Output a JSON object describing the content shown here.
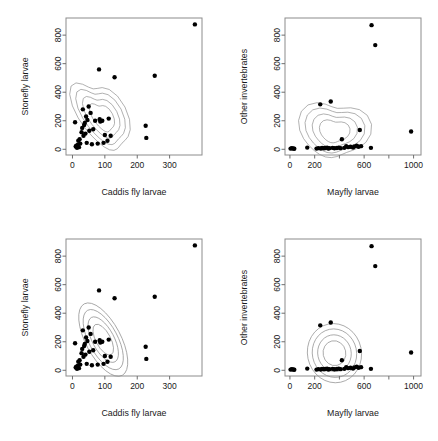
{
  "figure": {
    "title": "",
    "layout": "2x2 grid of scatter plots with density contours",
    "background": "#ffffff",
    "point_color": "#000000",
    "contour_color": "#8f8f8f"
  },
  "chart_data": [
    {
      "type": "scatter",
      "panel": "top-left",
      "title": "",
      "xlabel": "Caddis fly larvae",
      "ylabel": "Stonefly larvae",
      "xlim": [
        -20,
        400
      ],
      "ylim": [
        -40,
        920
      ],
      "xticks": [
        0,
        100,
        200,
        300
      ],
      "yticks": [
        0,
        200,
        400,
        600,
        800
      ],
      "xticklabels": [
        "0",
        "100",
        "200",
        "300"
      ],
      "yticklabels": [
        "0",
        "200",
        "400",
        "600",
        "800"
      ],
      "grid": false,
      "legend": "none",
      "contour_style": "kernel-density",
      "x": [
        8,
        10,
        12,
        14,
        16,
        18,
        20,
        22,
        24,
        28,
        30,
        32,
        34,
        36,
        38,
        40,
        42,
        44,
        46,
        50,
        52,
        56,
        60,
        64,
        70,
        78,
        82,
        84,
        86,
        92,
        96,
        100,
        108,
        112,
        118,
        130,
        226,
        228,
        254,
        378
      ],
      "y": [
        190,
        20,
        25,
        10,
        30,
        60,
        15,
        70,
        40,
        120,
        150,
        280,
        95,
        170,
        185,
        110,
        230,
        45,
        205,
        300,
        130,
        255,
        35,
        140,
        200,
        40,
        560,
        210,
        195,
        200,
        45,
        100,
        60,
        215,
        95,
        505,
        165,
        80,
        515,
        875
      ]
    },
    {
      "type": "scatter",
      "panel": "top-right",
      "title": "",
      "xlabel": "Mayfly larvae",
      "ylabel": "Other invertebrates",
      "xlim": [
        -40,
        1060
      ],
      "ylim": [
        -40,
        920
      ],
      "xticks": [
        0,
        200,
        400,
        600,
        800,
        1000
      ],
      "yticks": [
        0,
        200,
        400,
        600,
        800
      ],
      "xticklabels": [
        "0",
        "200",
        "",
        "600",
        "",
        "1000"
      ],
      "yticklabels": [
        "0",
        "200",
        "400",
        "600",
        "800"
      ],
      "grid": false,
      "legend": "none",
      "contour_style": "kernel-density",
      "x": [
        5,
        15,
        25,
        35,
        140,
        215,
        230,
        245,
        250,
        260,
        275,
        285,
        300,
        310,
        320,
        330,
        345,
        360,
        380,
        395,
        410,
        420,
        440,
        455,
        470,
        490,
        510,
        520,
        540,
        555,
        565,
        575,
        655,
        660,
        690,
        980
      ],
      "y": [
        5,
        8,
        6,
        4,
        12,
        5,
        8,
        315,
        6,
        10,
        7,
        9,
        12,
        6,
        8,
        335,
        10,
        7,
        9,
        12,
        8,
        70,
        10,
        22,
        15,
        18,
        12,
        20,
        25,
        18,
        135,
        22,
        10,
        870,
        730,
        125
      ]
    },
    {
      "type": "scatter",
      "panel": "bottom-left",
      "title": "",
      "xlabel": "Caddis fly larvae",
      "ylabel": "Stonefly larvae",
      "xlim": [
        -20,
        400
      ],
      "ylim": [
        -40,
        920
      ],
      "xticks": [
        0,
        100,
        200,
        300
      ],
      "yticks": [
        0,
        200,
        400,
        600,
        800
      ],
      "xticklabels": [
        "0",
        "100",
        "200",
        "300"
      ],
      "yticklabels": [
        "0",
        "200",
        "400",
        "600",
        "800"
      ],
      "grid": false,
      "legend": "none",
      "contour_style": "bivariate-normal-ellipse",
      "x": [
        8,
        10,
        12,
        14,
        16,
        18,
        20,
        22,
        24,
        28,
        30,
        32,
        34,
        36,
        38,
        40,
        42,
        44,
        46,
        50,
        52,
        56,
        60,
        64,
        70,
        78,
        82,
        84,
        86,
        92,
        96,
        100,
        108,
        112,
        118,
        130,
        226,
        228,
        254,
        378
      ],
      "y": [
        190,
        20,
        25,
        10,
        30,
        60,
        15,
        70,
        40,
        120,
        150,
        280,
        95,
        170,
        185,
        110,
        230,
        45,
        205,
        300,
        130,
        255,
        35,
        140,
        200,
        40,
        560,
        210,
        195,
        200,
        45,
        100,
        60,
        215,
        95,
        505,
        165,
        80,
        515,
        875
      ]
    },
    {
      "type": "scatter",
      "panel": "bottom-right",
      "title": "",
      "xlabel": "Mayfly larvae",
      "ylabel": "Other invertebrates",
      "xlim": [
        -40,
        1060
      ],
      "ylim": [
        -40,
        920
      ],
      "xticks": [
        0,
        200,
        400,
        600,
        800,
        1000
      ],
      "yticks": [
        0,
        200,
        400,
        600,
        800
      ],
      "xticklabels": [
        "0",
        "200",
        "",
        "600",
        "",
        "1000"
      ],
      "yticklabels": [
        "0",
        "200",
        "400",
        "600",
        "800"
      ],
      "grid": false,
      "legend": "none",
      "contour_style": "bivariate-normal-ellipse",
      "x": [
        5,
        15,
        25,
        35,
        140,
        215,
        230,
        245,
        250,
        260,
        275,
        285,
        300,
        310,
        320,
        330,
        345,
        360,
        380,
        395,
        410,
        420,
        440,
        455,
        470,
        490,
        510,
        520,
        540,
        555,
        565,
        575,
        655,
        660,
        690,
        980
      ],
      "y": [
        5,
        8,
        6,
        4,
        12,
        5,
        8,
        315,
        6,
        10,
        7,
        9,
        12,
        6,
        8,
        335,
        10,
        7,
        9,
        12,
        8,
        70,
        10,
        22,
        15,
        18,
        12,
        20,
        25,
        18,
        135,
        22,
        10,
        870,
        730,
        125
      ]
    }
  ]
}
